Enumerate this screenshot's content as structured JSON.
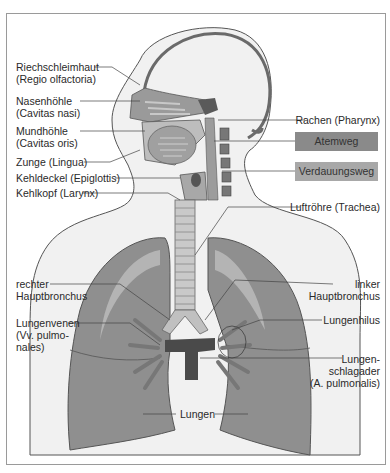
{
  "figure": {
    "type": "anatomical-diagram"
  },
  "labels": {
    "riechschleimhaut": [
      "Riechschleimhaut",
      "(Regio olfactoria)"
    ],
    "nasenhoehle": [
      "Nasenhöhle",
      "(Cavitas nasi)"
    ],
    "mundhoehle": [
      "Mundhöhle",
      "(Cavitas oris)"
    ],
    "zunge": "Zunge (Lingua)",
    "kehldeckel": "Kehldeckel (Epiglottis)",
    "kehlkopf": "Kehlkopf (Larynx)",
    "rachen": "Rachen (Pharynx)",
    "luftroehre": "Luftröhre (Trachea)",
    "rechter_hauptbronchus": [
      "rechter",
      "Hauptbronchus"
    ],
    "linker_hauptbronchus": [
      "linker",
      "Hauptbronchus"
    ],
    "lungenvenen": [
      "Lungenvenen",
      "(Vv. pulmo-",
      "nales)"
    ],
    "lungenhilus": "Lungenhilus",
    "lungenschlagader": [
      "Lungen-",
      "schlagader",
      "(A. pulmonalis)"
    ],
    "lungen": "Lungen"
  },
  "legend": {
    "items": [
      {
        "label": "Atemweg",
        "color": "#8a8a8a"
      },
      {
        "label": "Verdauungsweg",
        "color": "#a8a8a8"
      }
    ]
  },
  "colors": {
    "skin": "#f1f1f1",
    "outline": "#555555",
    "lung": "#8f8f8f",
    "lung_light": "#b4b4b4",
    "airway": "#9c9c9c",
    "vessel": "#4a4a4a",
    "frame": "#9a9a9a"
  }
}
